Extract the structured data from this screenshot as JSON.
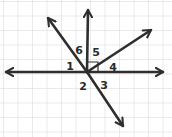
{
  "diagram": {
    "type": "angle-diagram",
    "background": "grid",
    "grid_color": "#d6d6d6",
    "line_color": "#2e2e2e",
    "center": [
      87,
      72
    ],
    "rays": [
      {
        "name": "ray-left",
        "to": [
          6,
          72
        ]
      },
      {
        "name": "ray-right",
        "to": [
          163,
          72
        ]
      },
      {
        "name": "ray-up",
        "to": [
          88,
          10
        ]
      },
      {
        "name": "ray-upper-left",
        "to": [
          48,
          18
        ]
      },
      {
        "name": "ray-upper-right",
        "to": [
          151,
          30
        ]
      },
      {
        "name": "ray-lower-right",
        "to": [
          123,
          126
        ]
      }
    ],
    "right_angle_marker": true,
    "angle_labels": [
      {
        "id": "1",
        "text": "1",
        "x": 70,
        "y": 66
      },
      {
        "id": "2",
        "text": "2",
        "x": 83,
        "y": 86
      },
      {
        "id": "3",
        "text": "3",
        "x": 104,
        "y": 85
      },
      {
        "id": "4",
        "text": "4",
        "x": 113,
        "y": 67
      },
      {
        "id": "5",
        "text": "5",
        "x": 96,
        "y": 52
      },
      {
        "id": "6",
        "text": "6",
        "x": 79,
        "y": 50
      }
    ]
  }
}
